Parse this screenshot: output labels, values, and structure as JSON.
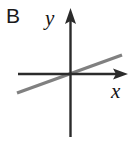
{
  "figure": {
    "panel_label": "B",
    "background_color": "#ffffff",
    "width": 136,
    "height": 143
  },
  "axes": {
    "x_axis_label": "x",
    "y_axis_label": "y",
    "axis_color": "#2b2b2b",
    "axis_stroke_width": 2.4,
    "origin": {
      "x": 70,
      "y": 74
    },
    "x_axis": {
      "x_start": 18,
      "x_end": 128,
      "y": 74,
      "arrow": "right"
    },
    "y_axis": {
      "x": 70,
      "y_start": 10,
      "y_end": 137,
      "arrow": "up"
    },
    "arrowhead_style": "solid-triangle"
  },
  "chart_data": {
    "type": "line",
    "title": "",
    "xlabel": "x",
    "ylabel": "y",
    "grid": false,
    "legend": null,
    "series": [
      {
        "name": "gray-line",
        "color": "#808080",
        "stroke_width": 3.4,
        "description": "straight line through the origin with a small positive slope",
        "slope": 0.36,
        "intercept": 0,
        "x": [
          -53,
          52
        ],
        "y": [
          -19,
          19
        ],
        "pixel_endpoints": [
          {
            "x": 17,
            "y": 93
          },
          {
            "x": 122,
            "y": 55
          }
        ]
      }
    ],
    "xlim": [
      -53,
      58
    ],
    "ylim": [
      -63,
      64
    ]
  }
}
